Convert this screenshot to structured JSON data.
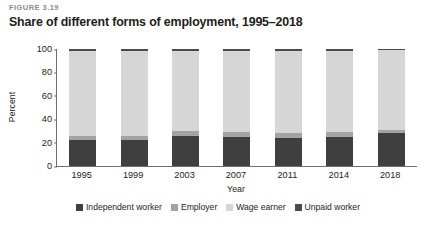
{
  "figure": {
    "number": "FIGURE 3.19",
    "title": "Share of different forms of employment, 1995–2018"
  },
  "chart_data": {
    "type": "bar",
    "subtype": "stacked-percentage",
    "title": "Share of different forms of employment, 1995–2018",
    "xlabel": "Year",
    "ylabel": "Percent",
    "categories": [
      "1995",
      "1999",
      "2003",
      "2007",
      "2011",
      "2014",
      "2018"
    ],
    "ylim": [
      0,
      100
    ],
    "yticks": [
      "0",
      "20",
      "40",
      "60",
      "80",
      "100"
    ],
    "grid": false,
    "legend_position": "bottom",
    "series": [
      {
        "name": "Independent worker",
        "color": "#3f3f3f",
        "values": [
          22,
          22,
          26,
          25,
          24,
          25,
          28
        ]
      },
      {
        "name": "Employer",
        "color": "#a3a3a3",
        "values": [
          4,
          4,
          4,
          4,
          4,
          4,
          3
        ]
      },
      {
        "name": "Wage earner",
        "color": "#d6d6d6",
        "values": [
          72.5,
          72.5,
          68.5,
          69.5,
          70.5,
          69.5,
          68
        ]
      },
      {
        "name": "Unpaid worker",
        "color": "#4a4a4a",
        "values": [
          1.5,
          1.5,
          1.5,
          1.5,
          1.5,
          1.5,
          1
        ]
      }
    ]
  }
}
